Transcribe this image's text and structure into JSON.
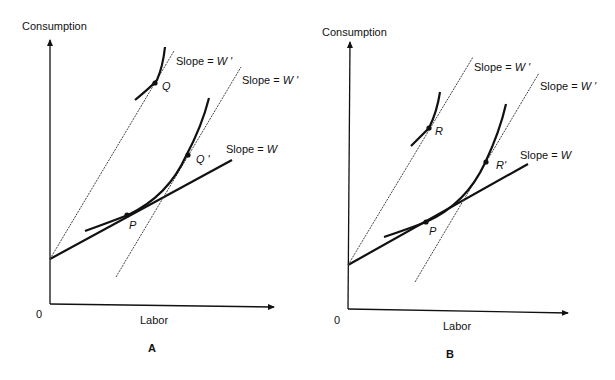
{
  "panels": [
    {
      "id": "A",
      "caption": "A",
      "y_axis_label": "Consumption",
      "x_axis_label": "Labor",
      "origin_label": "0",
      "budget_line_label": "Slope = ",
      "budget_line_var": "W",
      "new_wage_label_1": "Slope = ",
      "new_wage_var_1": "W '",
      "new_wage_label_2": "Slope = ",
      "new_wage_var_2": "W '",
      "points": {
        "initial": "P",
        "upper": "Q",
        "shifted": "Q '"
      }
    },
    {
      "id": "B",
      "caption": "B",
      "y_axis_label": "Consumption",
      "x_axis_label": "Labor",
      "origin_label": "0",
      "budget_line_label": "Slope = ",
      "budget_line_var": "W",
      "new_wage_label_1": "Slope = ",
      "new_wage_var_1": "W '",
      "new_wage_label_2": "Slope = ",
      "new_wage_var_2": "W '",
      "points": {
        "initial": "P",
        "upper": "R",
        "shifted": "R'"
      }
    }
  ],
  "colors": {
    "ink": "#111111",
    "dashed": "#555555",
    "background": "#ffffff"
  }
}
